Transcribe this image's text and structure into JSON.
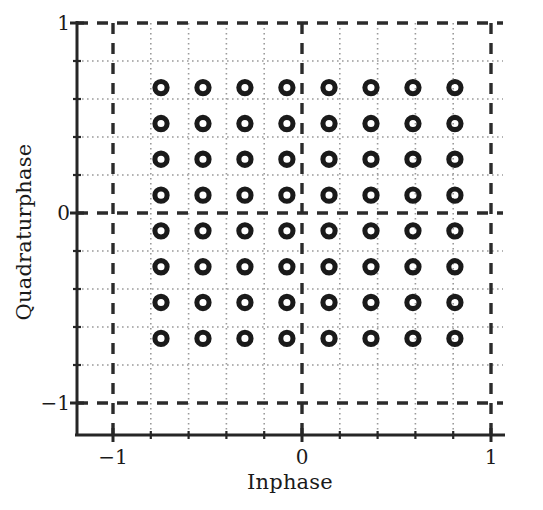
{
  "chart_data": {
    "type": "scatter",
    "title": "",
    "xlabel": "Inphase",
    "ylabel": "Quadraturphase",
    "xlim": [
      -1.18,
      1.19
    ],
    "ylim": [
      -1.19,
      1.09
    ],
    "xticks": [
      -1,
      0,
      1
    ],
    "xticklabels": [
      "-1",
      "0",
      "1"
    ],
    "yticks": [
      -1,
      0,
      1
    ],
    "yticklabels": [
      "-1",
      "0",
      "1"
    ],
    "grid": true,
    "grid_major_values": [
      -1,
      0,
      1
    ],
    "grid_minor_values": [
      -0.8,
      -0.6,
      -0.4,
      -0.2,
      0.2,
      0.4,
      0.6,
      0.8
    ],
    "legend": null,
    "marker": "open-circle",
    "marker_color": "#1a1a1a",
    "point_count": 64,
    "i_levels": [
      -0.746,
      -0.524,
      -0.302,
      -0.08,
      0.143,
      0.365,
      0.587,
      0.809
    ],
    "q_levels": [
      0.66,
      0.471,
      0.283,
      0.094,
      -0.094,
      -0.283,
      -0.471,
      -0.66
    ],
    "points": [
      {
        "i": -0.746,
        "q": 0.66
      },
      {
        "i": -0.524,
        "q": 0.66
      },
      {
        "i": -0.302,
        "q": 0.66
      },
      {
        "i": -0.08,
        "q": 0.66
      },
      {
        "i": 0.143,
        "q": 0.66
      },
      {
        "i": 0.365,
        "q": 0.66
      },
      {
        "i": 0.587,
        "q": 0.66
      },
      {
        "i": 0.809,
        "q": 0.66
      },
      {
        "i": -0.746,
        "q": 0.471
      },
      {
        "i": -0.524,
        "q": 0.471
      },
      {
        "i": -0.302,
        "q": 0.471
      },
      {
        "i": -0.08,
        "q": 0.471
      },
      {
        "i": 0.143,
        "q": 0.471
      },
      {
        "i": 0.365,
        "q": 0.471
      },
      {
        "i": 0.587,
        "q": 0.471
      },
      {
        "i": 0.809,
        "q": 0.471
      },
      {
        "i": -0.746,
        "q": 0.283
      },
      {
        "i": -0.524,
        "q": 0.283
      },
      {
        "i": -0.302,
        "q": 0.283
      },
      {
        "i": -0.08,
        "q": 0.283
      },
      {
        "i": 0.143,
        "q": 0.283
      },
      {
        "i": 0.365,
        "q": 0.283
      },
      {
        "i": 0.587,
        "q": 0.283
      },
      {
        "i": 0.809,
        "q": 0.283
      },
      {
        "i": -0.746,
        "q": 0.094
      },
      {
        "i": -0.524,
        "q": 0.094
      },
      {
        "i": -0.302,
        "q": 0.094
      },
      {
        "i": -0.08,
        "q": 0.094
      },
      {
        "i": 0.143,
        "q": 0.094
      },
      {
        "i": 0.365,
        "q": 0.094
      },
      {
        "i": 0.587,
        "q": 0.094
      },
      {
        "i": 0.809,
        "q": 0.094
      },
      {
        "i": -0.746,
        "q": -0.094
      },
      {
        "i": -0.524,
        "q": -0.094
      },
      {
        "i": -0.302,
        "q": -0.094
      },
      {
        "i": -0.08,
        "q": -0.094
      },
      {
        "i": 0.143,
        "q": -0.094
      },
      {
        "i": 0.365,
        "q": -0.094
      },
      {
        "i": 0.587,
        "q": -0.094
      },
      {
        "i": 0.809,
        "q": -0.094
      },
      {
        "i": -0.746,
        "q": -0.283
      },
      {
        "i": -0.524,
        "q": -0.283
      },
      {
        "i": -0.302,
        "q": -0.283
      },
      {
        "i": -0.08,
        "q": -0.283
      },
      {
        "i": 0.143,
        "q": -0.283
      },
      {
        "i": 0.365,
        "q": -0.283
      },
      {
        "i": 0.587,
        "q": -0.283
      },
      {
        "i": 0.809,
        "q": -0.283
      },
      {
        "i": -0.746,
        "q": -0.471
      },
      {
        "i": -0.524,
        "q": -0.471
      },
      {
        "i": -0.302,
        "q": -0.471
      },
      {
        "i": -0.08,
        "q": -0.471
      },
      {
        "i": 0.143,
        "q": -0.471
      },
      {
        "i": 0.365,
        "q": -0.471
      },
      {
        "i": 0.587,
        "q": -0.471
      },
      {
        "i": 0.809,
        "q": -0.471
      },
      {
        "i": -0.746,
        "q": -0.66
      },
      {
        "i": -0.524,
        "q": -0.66
      },
      {
        "i": -0.302,
        "q": -0.66
      },
      {
        "i": -0.08,
        "q": -0.66
      },
      {
        "i": 0.143,
        "q": -0.66
      },
      {
        "i": 0.365,
        "q": -0.66
      },
      {
        "i": 0.587,
        "q": -0.66
      },
      {
        "i": 0.809,
        "q": -0.66
      }
    ]
  },
  "axes": {
    "xlabel": "Inphase",
    "ylabel": "Quadraturphase",
    "xtick_labels": [
      "-1",
      "0",
      "1"
    ],
    "ytick_labels": [
      "1",
      "0",
      "-1"
    ]
  },
  "colors": {
    "marker": "#1f1f1f",
    "axis": "#262626",
    "grid_major": "#2b2b2b",
    "grid_minor": "#9a9a9a",
    "background": "#ffffff",
    "text": "#1a1a1a"
  }
}
